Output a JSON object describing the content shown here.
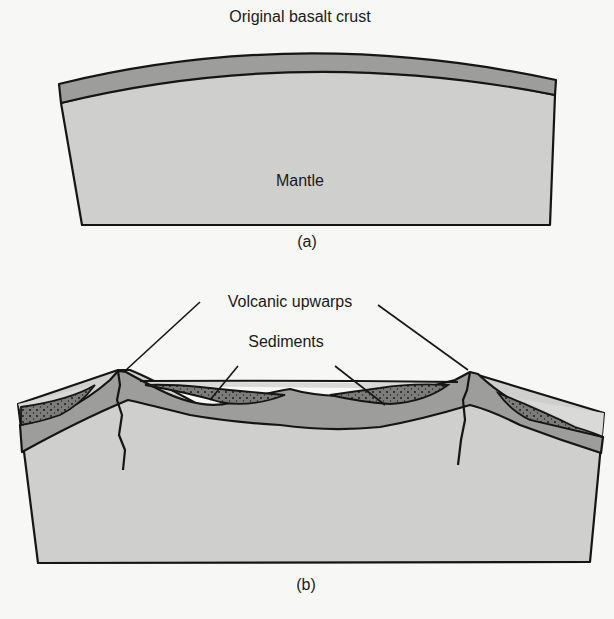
{
  "figure_a": {
    "title": "Original basalt crust",
    "mantle_label": "Mantle",
    "caption": "(a)"
  },
  "figure_b": {
    "volcanic_label": "Volcanic upwarps",
    "sediments_label": "Sediments",
    "caption": "(b)"
  },
  "colors": {
    "background": "#f7f7f5",
    "mantle": "#cfcfcd",
    "crust": "#9d9d9b",
    "sediment": "#7c7c7a",
    "outline": "#151515",
    "upper_water": "#d9d9d7"
  }
}
